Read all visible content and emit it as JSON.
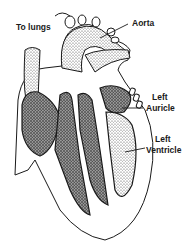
{
  "diagram": {
    "labels": {
      "to_lungs": "To lungs",
      "aorta": "Aorta",
      "left_auricle_line1": "Left",
      "left_auricle_line2": "Auricle",
      "left_ventricle_line1": "Left",
      "left_ventricle_line2": "Ventricle"
    },
    "colors": {
      "ink": "#1a1a1a",
      "stipple": "#555555",
      "background": "#ffffff"
    }
  }
}
